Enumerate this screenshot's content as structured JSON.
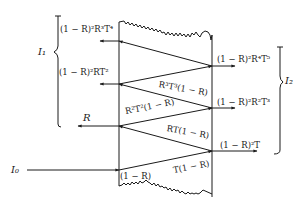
{
  "diagram": {
    "type": "multiple-reflection-slab",
    "stroke_color": "#1a1a1a",
    "incident": {
      "label": "I₀",
      "entry_coeff": "(1 − R)"
    },
    "reflected_direct": {
      "label": "R"
    },
    "internal_beams": [
      {
        "label": "T(1 − R)"
      },
      {
        "label": "RT(1 − R)"
      },
      {
        "label": "R²T²(1 − R)"
      },
      {
        "label": "R³T³(1 − R)"
      }
    ],
    "left_outputs": [
      {
        "label": "(1 − R)²R³T⁴"
      },
      {
        "label": "(1 − R)²RT²"
      }
    ],
    "right_outputs": [
      {
        "label": "(1 − R)²R⁴T⁵"
      },
      {
        "label": "(1 − R)²R²T³"
      },
      {
        "label": "(1 − R)²T"
      }
    ],
    "brace_left": {
      "label": "I₁"
    },
    "brace_right": {
      "label": "I₂"
    }
  }
}
